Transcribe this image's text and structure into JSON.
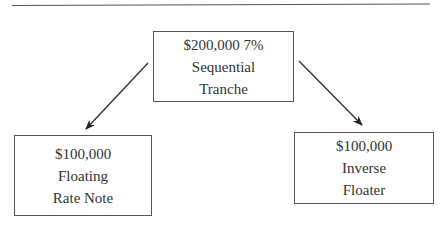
{
  "diagram": {
    "type": "tranche-split-flow",
    "nodes": [
      {
        "id": "sequential",
        "lines": [
          "$200,000 7%",
          "Sequential",
          "Tranche"
        ]
      },
      {
        "id": "floater",
        "lines": [
          "$100,000",
          "Floating",
          "Rate Note"
        ]
      },
      {
        "id": "inverse",
        "lines": [
          "$100,000",
          "Inverse",
          "Floater"
        ]
      }
    ],
    "edges": [
      {
        "from": "sequential",
        "to": "floater"
      },
      {
        "from": "sequential",
        "to": "inverse"
      }
    ],
    "colors": {
      "line": "#333333",
      "border": "#555555",
      "text": "#333333"
    }
  }
}
